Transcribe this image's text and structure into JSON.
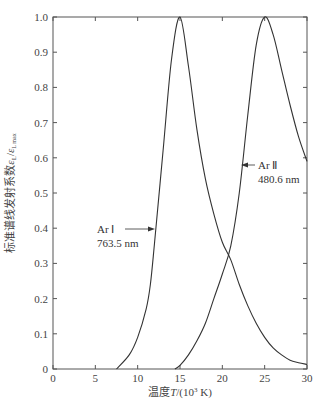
{
  "chart_data": {
    "type": "line",
    "title": "",
    "xlabel": "温度T/(10³ K)",
    "ylabel": "标准谱线发射系数ε_L/ε_Lmax",
    "xlim": [
      0,
      30
    ],
    "ylim": [
      0,
      1.0
    ],
    "x_ticks": [
      "0",
      "5",
      "10",
      "15",
      "20",
      "25",
      "30"
    ],
    "y_ticks": [
      "0",
      "0.1",
      "0.2",
      "0.3",
      "0.4",
      "0.5",
      "0.6",
      "0.7",
      "0.8",
      "0.9",
      "1.0"
    ],
    "grid": false,
    "legend": "none (inline annotations)",
    "series": [
      {
        "name": "Ar I 763.5 nm",
        "x": [
          7.5,
          9,
          10,
          11,
          11.5,
          12,
          13,
          14,
          15,
          16,
          17,
          18,
          19,
          20,
          21,
          22,
          23,
          24,
          25,
          26,
          27,
          28,
          29,
          30
        ],
        "values": [
          0,
          0.04,
          0.09,
          0.17,
          0.24,
          0.36,
          0.62,
          0.88,
          1.0,
          0.86,
          0.68,
          0.54,
          0.44,
          0.36,
          0.31,
          0.24,
          0.18,
          0.13,
          0.09,
          0.06,
          0.04,
          0.025,
          0.018,
          0.013
        ]
      },
      {
        "name": "Ar II 480.6 nm",
        "x": [
          14.4,
          15,
          16,
          17,
          18,
          19,
          20,
          21,
          22,
          23,
          24,
          25,
          26,
          27,
          28,
          29,
          30
        ],
        "values": [
          0,
          0.01,
          0.04,
          0.08,
          0.13,
          0.2,
          0.27,
          0.35,
          0.5,
          0.72,
          0.92,
          1.0,
          0.95,
          0.85,
          0.75,
          0.66,
          0.59
        ]
      }
    ],
    "annotations": [
      {
        "text_line1": "Ar Ⅰ",
        "text_line2": "763.5 nm",
        "arrow_to": [
          12.0,
          0.4
        ]
      },
      {
        "text_line1": "Ar Ⅱ",
        "text_line2": "480.6 nm",
        "arrow_to": [
          22.2,
          0.58
        ]
      }
    ]
  },
  "labels": {
    "xlabel_main": "温度",
    "xlabel_var": "T",
    "xlabel_unit_open": "/(10",
    "xlabel_exp": "3",
    "xlabel_unit_close": " K)",
    "ylabel_main": "标准谱线发射系数",
    "ylabel_sym": "ε",
    "ylabel_sub": "L",
    "ylabel_slash": "/",
    "ylabel_sym2": "ε",
    "ylabel_sub2": "L max",
    "ann1_line1": "Ar Ⅰ",
    "ann1_line2": "763.5 nm",
    "ann2_line1": "Ar Ⅱ",
    "ann2_line2": "480.6 nm"
  },
  "colors": {
    "line": "#333333",
    "axis": "#555555",
    "background": "#ffffff"
  }
}
